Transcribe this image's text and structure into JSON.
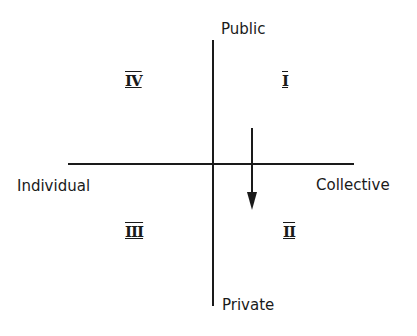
{
  "diagram": {
    "type": "quadrant",
    "axes": {
      "vertical": {
        "top_label": "Public",
        "bottom_label": "Private"
      },
      "horizontal": {
        "left_label": "Individual",
        "right_label": "Collective"
      }
    },
    "quadrants": [
      {
        "id": "I",
        "label": "I",
        "position": "top-right"
      },
      {
        "id": "II",
        "label": "II",
        "position": "bottom-right"
      },
      {
        "id": "III",
        "label": "III",
        "position": "bottom-left"
      },
      {
        "id": "IV",
        "label": "IV",
        "position": "top-left"
      }
    ],
    "arrow": {
      "from_quadrant": "I",
      "to_quadrant": "II",
      "direction": "down"
    },
    "colors": {
      "line": "#1a1a1a",
      "background": "#ffffff"
    }
  }
}
